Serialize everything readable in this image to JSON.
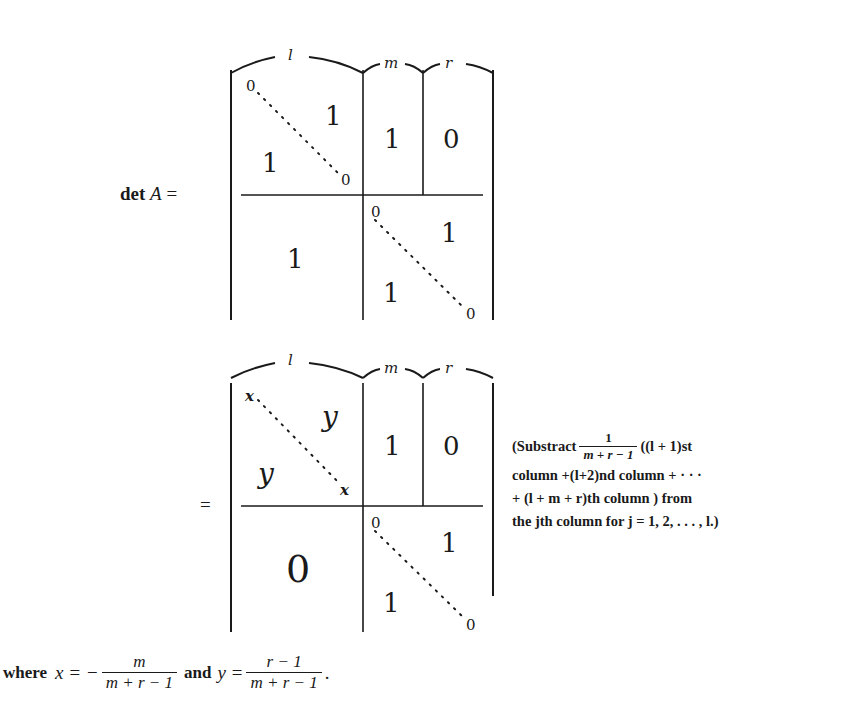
{
  "first_matrix": {
    "lhs": "det A =",
    "lhs_det": "det",
    "lhs_var": "A",
    "lhs_eq": "=",
    "brace_labels": {
      "l": "l",
      "m": "m",
      "r": "r"
    },
    "top_left_block": {
      "diag_start": "0",
      "diag_end": "0",
      "upper": "1",
      "lower": "1"
    },
    "top_middle_block": "1",
    "top_right_block": "0",
    "bottom_left_block": "1",
    "bottom_right_block": {
      "diag_start": "0",
      "diag_end": "0",
      "upper": "1",
      "lower": "1"
    }
  },
  "second_matrix": {
    "lhs_eq": "=",
    "brace_labels": {
      "l": "l",
      "m": "m",
      "r": "r"
    },
    "top_left_block": {
      "diag_start": "x",
      "diag_end": "x",
      "upper": "y",
      "lower": "y"
    },
    "top_middle_block": "1",
    "top_right_block": "0",
    "bottom_left_block": "0",
    "bottom_right_block": {
      "diag_start": "0",
      "diag_end": "0",
      "upper": "1",
      "lower": "1"
    }
  },
  "annotation": {
    "line1_prefix": "(Substract",
    "line1_frac_num": "1",
    "line1_frac_den": "m + r − 1",
    "line1_suffix": "((l + 1)st",
    "line2": "column +(l+2)nd column + · · ·",
    "line3": "+ (l + m + r)th column ) from",
    "line4": "the jth column for j = 1, 2, . . . , l.)"
  },
  "footer": {
    "where": "where",
    "x_def": "x = −",
    "x_num": "m",
    "x_den": "m + r − 1",
    "and": "and",
    "y_def": "y =",
    "y_num": "r − 1",
    "y_den": "m + r − 1",
    "period": "."
  }
}
